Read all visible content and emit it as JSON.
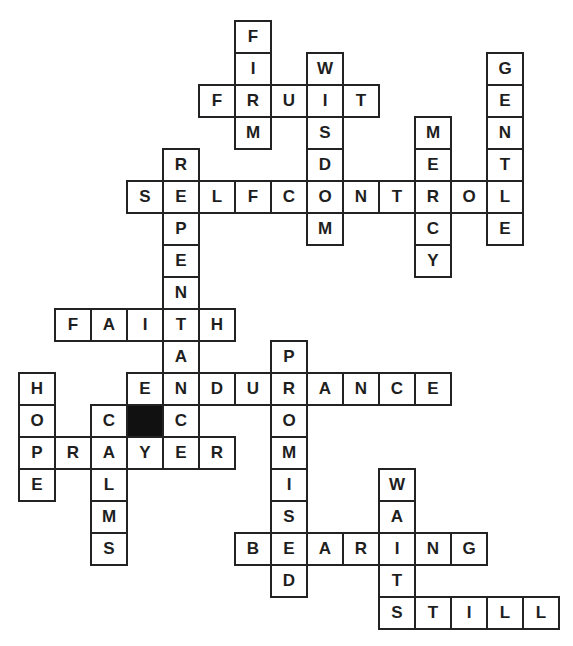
{
  "puzzle": {
    "type": "crossword",
    "grid": {
      "origin_x": 18,
      "origin_y": 20,
      "cell_width": 36,
      "cell_height": 32,
      "line_color": "#232323",
      "block_color": "#111111",
      "letter_color": "#1e1e1e"
    },
    "words": [
      {
        "word": "FIRM",
        "direction": "down",
        "row": 0,
        "col": 6
      },
      {
        "word": "WISDOM",
        "direction": "down",
        "row": 1,
        "col": 8
      },
      {
        "word": "GENTLE",
        "direction": "down",
        "row": 1,
        "col": 13
      },
      {
        "word": "FRUIT",
        "direction": "across",
        "row": 2,
        "col": 5
      },
      {
        "word": "MERCY",
        "direction": "down",
        "row": 3,
        "col": 11
      },
      {
        "word": "REPENTANCE",
        "direction": "down",
        "row": 4,
        "col": 4
      },
      {
        "word": "SELFCONTROL",
        "direction": "across",
        "row": 5,
        "col": 3
      },
      {
        "word": "FAITH",
        "direction": "across",
        "row": 9,
        "col": 1
      },
      {
        "word": "PROMISED",
        "direction": "down",
        "row": 10,
        "col": 7
      },
      {
        "word": "ENDURANCE",
        "direction": "across",
        "row": 11,
        "col": 3
      },
      {
        "word": "HOPE",
        "direction": "down",
        "row": 11,
        "col": 0
      },
      {
        "word": "CALMS",
        "direction": "down",
        "row": 12,
        "col": 2
      },
      {
        "word": "PRAYER",
        "direction": "across",
        "row": 13,
        "col": 0
      },
      {
        "word": "WAITS",
        "direction": "down",
        "row": 14,
        "col": 10
      },
      {
        "word": "BEARING",
        "direction": "across",
        "row": 16,
        "col": 6
      },
      {
        "word": "STILL",
        "direction": "across",
        "row": 18,
        "col": 10
      }
    ],
    "blocks": [
      {
        "row": 12,
        "col": 3
      }
    ]
  }
}
